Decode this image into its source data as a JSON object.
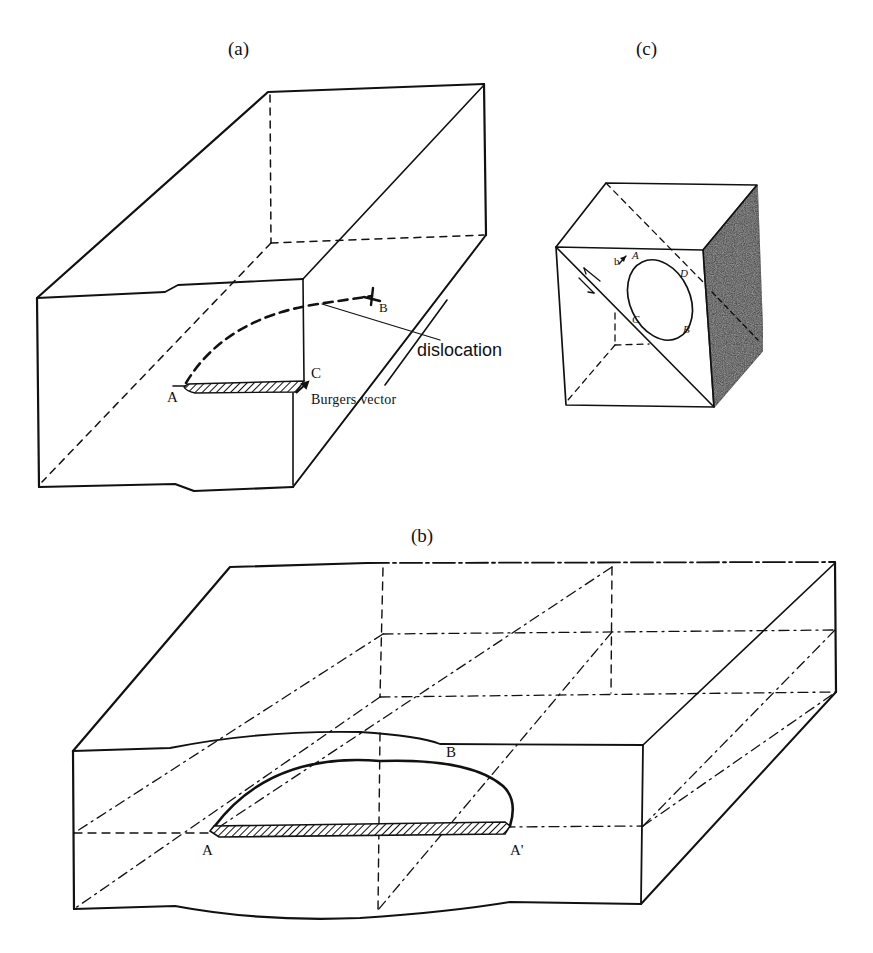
{
  "figure": {
    "panels": [
      {
        "id": "a",
        "label": "(a)",
        "points": {
          "A": "A",
          "B": "B",
          "C": "C"
        },
        "annotations": {
          "dislocation": "dislocation",
          "burgers_vector": "Burgers vector"
        }
      },
      {
        "id": "b",
        "label": "(b)",
        "points": {
          "A": "A",
          "A_prime": "A'",
          "B": "B"
        }
      },
      {
        "id": "c",
        "label": "(c)",
        "points": {
          "A": "A",
          "B": "B",
          "C": "C",
          "D": "D",
          "b": "b"
        }
      }
    ],
    "colors": {
      "ink": "#111111",
      "background": "#ffffff",
      "shaded_face": "#3a3a3a"
    }
  }
}
